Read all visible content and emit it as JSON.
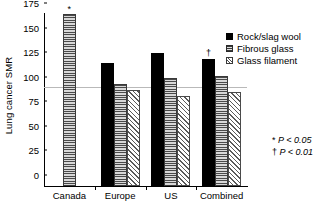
{
  "chart_data": {
    "type": "bar",
    "title": "",
    "xlabel": "",
    "ylabel": "Lung cancer SMR",
    "ylim": [
      0,
      175
    ],
    "yticks": [
      0,
      25,
      50,
      75,
      100,
      125,
      150,
      175
    ],
    "grid": false,
    "reference_line": 100,
    "legend_position": "top-right",
    "categories": [
      "Canada",
      "Europe",
      "US",
      "Combined"
    ],
    "series": [
      {
        "name": "Rock/slag wool",
        "values": [
          null,
          125,
          135,
          129
        ]
      },
      {
        "name": "Fibrous glass",
        "values": [
          175,
          104,
          110,
          112
        ]
      },
      {
        "name": "Glass filament",
        "values": [
          null,
          98,
          92,
          96
        ]
      }
    ],
    "annotations": [
      {
        "text": "*",
        "category": "Canada",
        "series": "Fibrous glass",
        "meaning": "P < 0.05"
      },
      {
        "text": "†",
        "category": "Combined",
        "series": "Rock/slag wool",
        "meaning": "P < 0.01"
      }
    ]
  },
  "legend": {
    "items": [
      {
        "label": "Rock/slag wool",
        "pattern": "solid"
      },
      {
        "label": "Fibrous glass",
        "pattern": "horiz"
      },
      {
        "label": "Glass filament",
        "pattern": "diag"
      }
    ]
  },
  "footnotes": [
    {
      "marker": "*",
      "text": "P < 0.05"
    },
    {
      "marker": "†",
      "text": "P < 0.01"
    }
  ],
  "colors": {
    "rock_slag_wool": "#000000",
    "fibrous_glass": "#7a7a7a",
    "glass_filament": "#ffffff",
    "axis": "#000000",
    "reference_line": "#b9b9b9",
    "background": "#ffffff"
  }
}
